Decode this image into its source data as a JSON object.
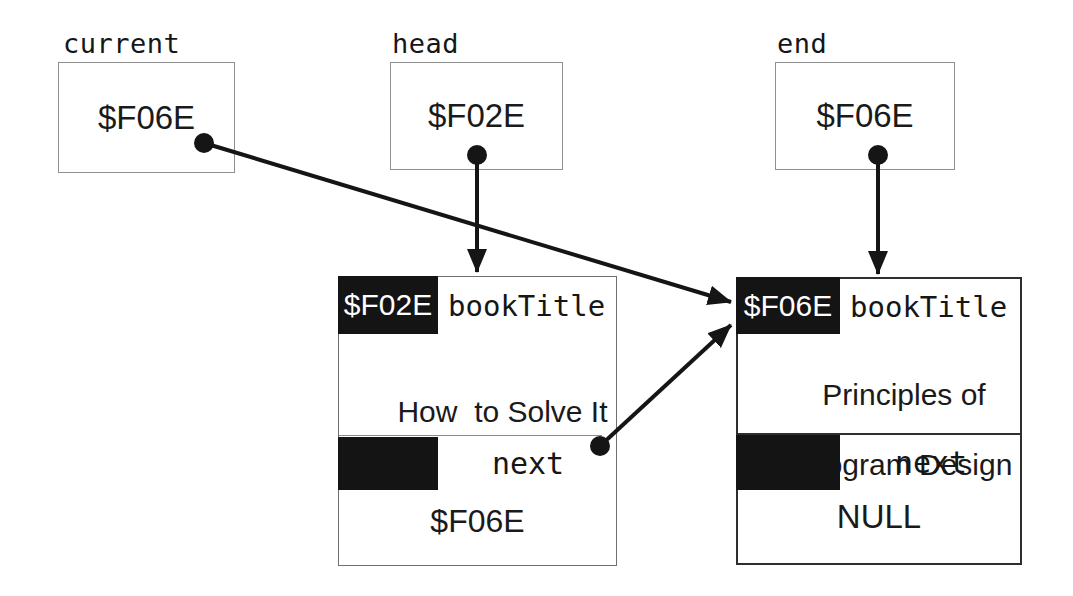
{
  "colors": {
    "ink": "#161616",
    "cell_fill": "#141414",
    "background": "#ffffff"
  },
  "pointers": [
    {
      "label": "current",
      "value": "$F06E"
    },
    {
      "label": "head",
      "value": "$F02E"
    },
    {
      "label": "end",
      "value": "$F06E"
    }
  ],
  "nodes": [
    {
      "address": "$F02E",
      "address_field": "bookTitle",
      "title_lines": [
        "How  to Solve It"
      ],
      "next_field": "next",
      "next_value": "$F06E"
    },
    {
      "address": "$F06E",
      "address_field": "bookTitle",
      "title_lines": [
        "Principles of",
        "Program Design"
      ],
      "next_field": "next",
      "next_value": "NULL"
    }
  ],
  "arrows": [
    {
      "from": "current",
      "to": "node-f06e-address-cell"
    },
    {
      "from": "head",
      "to": "node-f02e-top"
    },
    {
      "from": "end",
      "to": "node-f06e-top"
    },
    {
      "from": "node-f02e-next",
      "to": "node-f06e-address-cell"
    }
  ]
}
